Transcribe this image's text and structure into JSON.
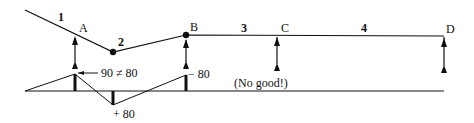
{
  "beam": {
    "points": {
      "A": "A",
      "B": "B",
      "C": "C",
      "D": "D"
    },
    "spans": {
      "s1": "1",
      "s2": "2",
      "s3": "3",
      "s4": "4"
    }
  },
  "moment_diagram": {
    "label_A": "90 ≠ 80",
    "label_hinge": "+ 80",
    "label_B": "− 80",
    "note": "(No good!)"
  },
  "colors": {
    "ink": "#111111",
    "background": "#ffffff"
  }
}
